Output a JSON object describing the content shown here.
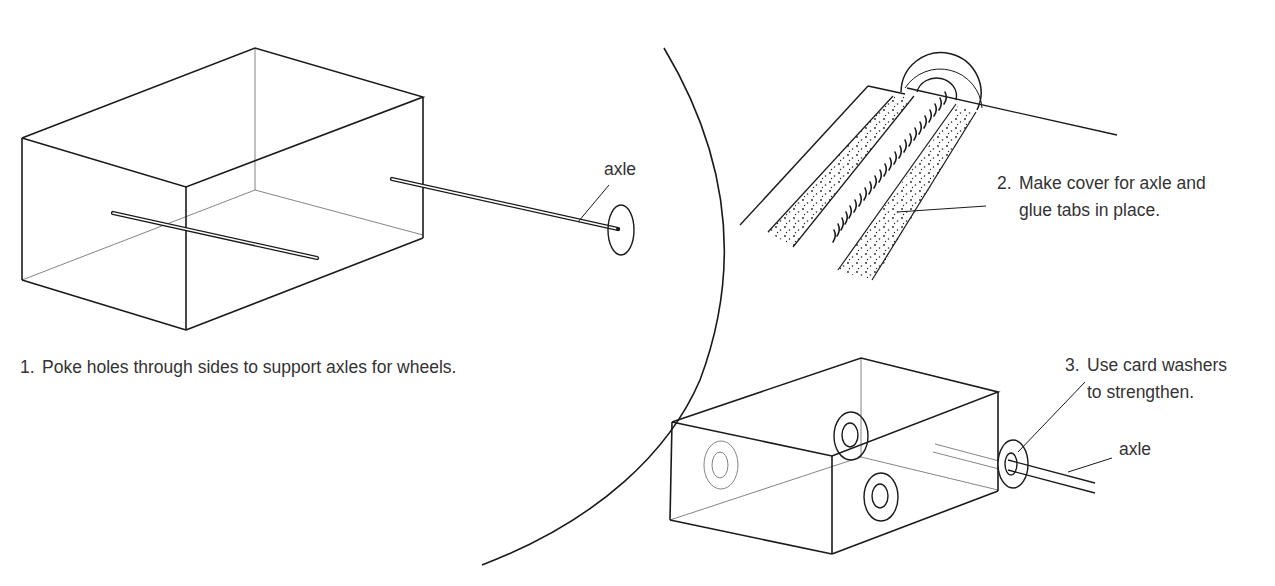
{
  "diagram": {
    "theme": {
      "ink": "#1a1a1a",
      "thin_ink": "#555555",
      "text": "#333333",
      "background": "#ffffff"
    },
    "panels": [
      {
        "id": "step-1",
        "label": "axle",
        "caption_number": "1.",
        "caption": "Poke holes through sides to support axles for wheels."
      },
      {
        "id": "step-2",
        "caption_number": "2.",
        "caption_line1": "Make cover for axle and",
        "caption_line2": "glue tabs in place."
      },
      {
        "id": "step-3",
        "caption_number": "3.",
        "caption_line1": "Use card washers",
        "caption_line2": "to strengthen.",
        "label": "axle"
      }
    ]
  }
}
